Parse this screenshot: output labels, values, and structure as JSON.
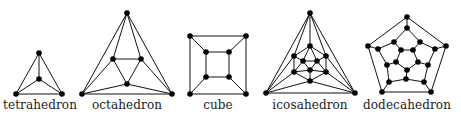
{
  "colors": {
    "edge": "#111111",
    "node": "#000000",
    "text": "#1a1a1a",
    "background": "#ffffff"
  },
  "node_radius": 2.8,
  "graphs": [
    {
      "id": "tetrahedron",
      "label": "tetrahedron",
      "label_x": 40,
      "nodes": [
        [
          39,
          53
        ],
        [
          39,
          79
        ],
        [
          16,
          94
        ],
        [
          62,
          94
        ]
      ],
      "edges": [
        [
          0,
          1
        ],
        [
          0,
          2
        ],
        [
          0,
          3
        ],
        [
          1,
          2
        ],
        [
          1,
          3
        ],
        [
          2,
          3
        ]
      ]
    },
    {
      "id": "octahedron",
      "label": "octahedron",
      "label_x": 127,
      "nodes": [
        [
          127,
          13
        ],
        [
          113,
          59
        ],
        [
          141,
          59
        ],
        [
          127,
          84
        ],
        [
          82,
          94
        ],
        [
          172,
          94
        ]
      ],
      "edges": [
        [
          0,
          1
        ],
        [
          0,
          2
        ],
        [
          0,
          4
        ],
        [
          0,
          5
        ],
        [
          1,
          2
        ],
        [
          1,
          3
        ],
        [
          2,
          3
        ],
        [
          1,
          4
        ],
        [
          2,
          5
        ],
        [
          3,
          4
        ],
        [
          3,
          5
        ],
        [
          4,
          5
        ]
      ]
    },
    {
      "id": "cube",
      "label": "cube",
      "label_x": 218,
      "nodes": [
        [
          190,
          36
        ],
        [
          246,
          36
        ],
        [
          246,
          94
        ],
        [
          190,
          94
        ],
        [
          206,
          52
        ],
        [
          229,
          52
        ],
        [
          229,
          77
        ],
        [
          206,
          77
        ]
      ],
      "edges": [
        [
          0,
          1
        ],
        [
          1,
          2
        ],
        [
          2,
          3
        ],
        [
          3,
          0
        ],
        [
          4,
          5
        ],
        [
          5,
          6
        ],
        [
          6,
          7
        ],
        [
          7,
          4
        ],
        [
          0,
          4
        ],
        [
          1,
          5
        ],
        [
          2,
          6
        ],
        [
          3,
          7
        ]
      ]
    },
    {
      "id": "icosahedron",
      "label": "icosahedron",
      "label_x": 310,
      "nodes": [
        [
          310,
          13
        ],
        [
          266,
          93
        ],
        [
          355,
          93
        ],
        [
          310,
          46
        ],
        [
          294,
          56
        ],
        [
          326,
          56
        ],
        [
          294,
          72
        ],
        [
          326,
          72
        ],
        [
          310,
          81
        ],
        [
          303,
          61
        ],
        [
          317,
          61
        ],
        [
          310,
          70
        ]
      ],
      "edges": [
        [
          0,
          1
        ],
        [
          0,
          2
        ],
        [
          1,
          2
        ],
        [
          0,
          3
        ],
        [
          0,
          4
        ],
        [
          0,
          5
        ],
        [
          1,
          4
        ],
        [
          1,
          6
        ],
        [
          1,
          8
        ],
        [
          2,
          5
        ],
        [
          2,
          7
        ],
        [
          2,
          8
        ],
        [
          3,
          4
        ],
        [
          3,
          5
        ],
        [
          4,
          6
        ],
        [
          5,
          7
        ],
        [
          6,
          8
        ],
        [
          7,
          8
        ],
        [
          3,
          9
        ],
        [
          3,
          10
        ],
        [
          4,
          9
        ],
        [
          5,
          10
        ],
        [
          6,
          9
        ],
        [
          6,
          11
        ],
        [
          7,
          10
        ],
        [
          7,
          11
        ],
        [
          8,
          11
        ],
        [
          9,
          10
        ],
        [
          10,
          11
        ],
        [
          11,
          9
        ]
      ]
    },
    {
      "id": "dodecahedron",
      "label": "dodecahedron",
      "label_x": 407,
      "nodes": [
        [
          407,
          17
        ],
        [
          446,
          46
        ],
        [
          431,
          92
        ],
        [
          382,
          92
        ],
        [
          368,
          46
        ],
        [
          407,
          28
        ],
        [
          420,
          42
        ],
        [
          435,
          49
        ],
        [
          428,
          65
        ],
        [
          424,
          82
        ],
        [
          406,
          79
        ],
        [
          389,
          82
        ],
        [
          387,
          65
        ],
        [
          378,
          49
        ],
        [
          394,
          42
        ],
        [
          401,
          50
        ],
        [
          413,
          50
        ],
        [
          418,
          62
        ],
        [
          407,
          70
        ],
        [
          396,
          62
        ]
      ],
      "edges": [
        [
          0,
          1
        ],
        [
          1,
          2
        ],
        [
          2,
          3
        ],
        [
          3,
          4
        ],
        [
          4,
          0
        ],
        [
          0,
          5
        ],
        [
          1,
          7
        ],
        [
          2,
          9
        ],
        [
          3,
          11
        ],
        [
          4,
          13
        ],
        [
          5,
          6
        ],
        [
          6,
          7
        ],
        [
          7,
          8
        ],
        [
          8,
          9
        ],
        [
          9,
          10
        ],
        [
          10,
          11
        ],
        [
          11,
          12
        ],
        [
          12,
          13
        ],
        [
          13,
          14
        ],
        [
          14,
          5
        ],
        [
          14,
          15
        ],
        [
          6,
          16
        ],
        [
          8,
          17
        ],
        [
          10,
          18
        ],
        [
          12,
          19
        ],
        [
          15,
          16
        ],
        [
          16,
          17
        ],
        [
          17,
          18
        ],
        [
          18,
          19
        ],
        [
          19,
          15
        ]
      ]
    }
  ]
}
